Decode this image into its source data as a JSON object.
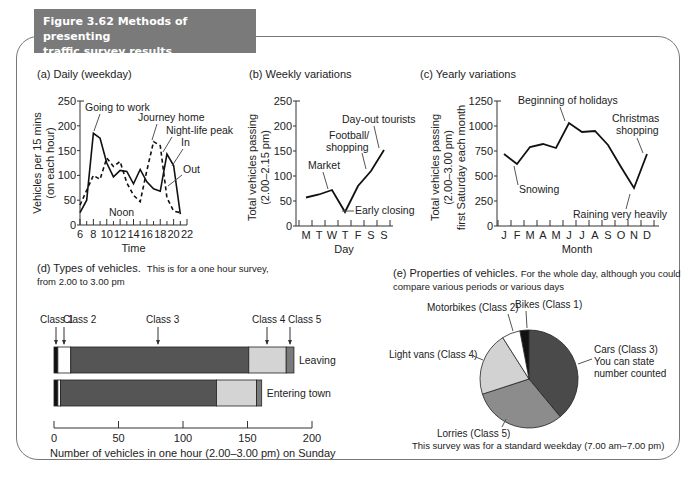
{
  "figure": {
    "title_line1": "Figure 3.62  Methods of presenting",
    "title_line2": "traffic survey results",
    "header_bg": "#7a7a7a"
  },
  "panels": {
    "a": {
      "title": "(a) Daily (weekday)"
    },
    "b": {
      "title": "(b) Weekly variations"
    },
    "c": {
      "title": "(c) Yearly variations"
    },
    "d": {
      "title": "(d) Types of vehicles.",
      "subtitle": "This is for a one hour survey,",
      "subtitle2": "from 2.00 to 3.00 pm"
    },
    "e": {
      "title": "(e) Properties of vehicles.",
      "subtitle": "For the whole day, although you could",
      "subtitle2": "compare various periods or various days",
      "footnote": "This survey was for a standard weekday (7.00 am–7.00 pm)"
    }
  },
  "chart_data": [
    {
      "id": "a",
      "type": "line",
      "title": "(a) Daily (weekday)",
      "xlabel": "Time",
      "ylabel": "Vehicles per 15 mins",
      "ylabel2": "(on each hour)",
      "xlim": [
        6,
        22
      ],
      "ylim": [
        0,
        250
      ],
      "xticks": [
        "6",
        "8",
        "10",
        "12",
        "14",
        "16",
        "18",
        "20",
        "22"
      ],
      "yticks": [
        "0",
        "50",
        "100",
        "150",
        "200",
        "250"
      ],
      "series": [
        {
          "name": "In",
          "style": "solid",
          "x": [
            6,
            7,
            8,
            9,
            10,
            11,
            12,
            13,
            14,
            15,
            16,
            17,
            18,
            19,
            20,
            21
          ],
          "values": [
            25,
            50,
            185,
            175,
            125,
            97,
            110,
            108,
            83,
            112,
            87,
            73,
            68,
            143,
            120,
            22
          ]
        },
        {
          "name": "Out",
          "style": "dashed",
          "x": [
            6,
            7,
            8,
            9,
            10,
            11,
            12,
            13,
            14,
            15,
            16,
            17,
            18,
            19,
            20,
            21
          ],
          "values": [
            40,
            70,
            100,
            92,
            135,
            118,
            128,
            85,
            60,
            47,
            110,
            168,
            160,
            55,
            28,
            25
          ]
        }
      ],
      "annotations": [
        "Going to work",
        "Journey home",
        "Night-life peak",
        "In",
        "Out",
        "Noon"
      ]
    },
    {
      "id": "b",
      "type": "line",
      "title": "(b) Weekly variations",
      "xlabel": "Day",
      "ylabel": "Total vehicles passing",
      "ylabel2": "(2.00–2.15 pm)",
      "ylim": [
        0,
        250
      ],
      "categories": [
        "M",
        "T",
        "W",
        "T",
        "F",
        "S",
        "S"
      ],
      "yticks": [
        "0",
        "50",
        "100",
        "150",
        "200",
        "250"
      ],
      "values": [
        57,
        63,
        72,
        28,
        80,
        110,
        152
      ],
      "annotations": [
        "Market",
        "Early closing",
        "Football/",
        "shopping",
        "Day-out tourists"
      ]
    },
    {
      "id": "c",
      "type": "line",
      "title": "(c) Yearly variations",
      "xlabel": "Month",
      "ylabel": "Total vehicles passing",
      "ylabel2": "(2.00–3.00 pm)",
      "ylabel3": "first Saturday each month",
      "ylim": [
        0,
        1250
      ],
      "categories": [
        "J",
        "F",
        "M",
        "A",
        "M",
        "J",
        "J",
        "A",
        "S",
        "O",
        "N",
        "D"
      ],
      "yticks": [
        "0",
        "250",
        "500",
        "750",
        "1000",
        "1250"
      ],
      "values": [
        720,
        620,
        790,
        820,
        780,
        1030,
        940,
        950,
        810,
        590,
        380,
        720
      ],
      "annotations": [
        "Beginning of holidays",
        "Snowing",
        "Christmas",
        "shopping",
        "Raining very heavily"
      ]
    },
    {
      "id": "d",
      "type": "bar",
      "orientation": "horizontal-stacked",
      "xlabel": "Number of vehicles in one hour (2.00–3.00 pm) on Sunday",
      "xlim": [
        0,
        200
      ],
      "xticks": [
        "0",
        "50",
        "100",
        "150",
        "200"
      ],
      "categories": [
        "Leaving",
        "Entering town"
      ],
      "series": [
        {
          "name": "Class 1",
          "color": "#111111",
          "values": [
            3,
            3
          ]
        },
        {
          "name": "Class 2",
          "color": "#ffffff",
          "values": [
            10,
            2
          ]
        },
        {
          "name": "Class 3",
          "color": "#555555",
          "values": [
            138,
            121
          ]
        },
        {
          "name": "Class 4",
          "color": "#d4d4d4",
          "values": [
            29,
            31
          ]
        },
        {
          "name": "Class 5",
          "color": "#7a7a7a",
          "values": [
            6,
            4
          ]
        }
      ]
    },
    {
      "id": "e",
      "type": "pie",
      "title": "(e) Properties of vehicles.",
      "labels": [
        "Bikes (Class 1)",
        "Cars (Class 3)",
        "Lorries (Class 5)",
        "Light vans (Class 4)",
        "Motorbikes (Class 2)"
      ],
      "values": [
        3,
        39,
        31,
        21,
        6
      ],
      "colors": [
        "#111111",
        "#4a4a4a",
        "#8c8c8c",
        "#d2d2d2",
        "#ffffff"
      ],
      "annotations": [
        "You can state",
        "number counted"
      ]
    }
  ]
}
